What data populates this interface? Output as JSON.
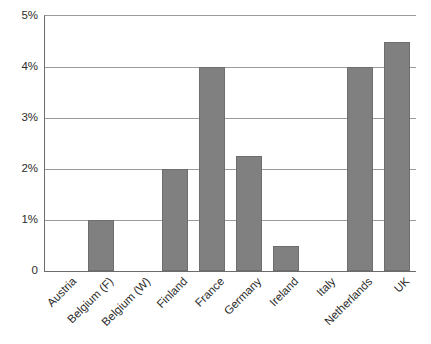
{
  "chart_data": {
    "type": "bar",
    "title": "",
    "subtitle": "",
    "xlabel": "",
    "ylabel": "",
    "categories": [
      "Austria",
      "Belgium (F)",
      "Belgium (W)",
      "Finland",
      "France",
      "Germany",
      "Ireland",
      "Italy",
      "Netherlands",
      "UK"
    ],
    "values": [
      0,
      1,
      0,
      2,
      4,
      2.25,
      0.5,
      0,
      4,
      4.5
    ],
    "value_unit": "%",
    "ylim": [
      0,
      5
    ],
    "yticks": [
      0,
      1,
      2,
      3,
      4,
      5
    ],
    "ytick_labels": [
      "0",
      "1%",
      "2%",
      "3%",
      "4%",
      "5%"
    ],
    "grid": true,
    "grid_axis": "y",
    "legend": false,
    "legend_position": "none",
    "annotations": [],
    "series": [
      {
        "name": "",
        "values": [
          0,
          1,
          0,
          2,
          4,
          2.25,
          0.5,
          0,
          4,
          4.5
        ]
      }
    ]
  },
  "style": {
    "bar_fill": "#808080",
    "bar_stroke": "#6e6e6e",
    "axis_color": "#6b6b6b",
    "grid_color": "#9a9a9a",
    "text_color": "#2b2b2b",
    "background": "#ffffff"
  }
}
